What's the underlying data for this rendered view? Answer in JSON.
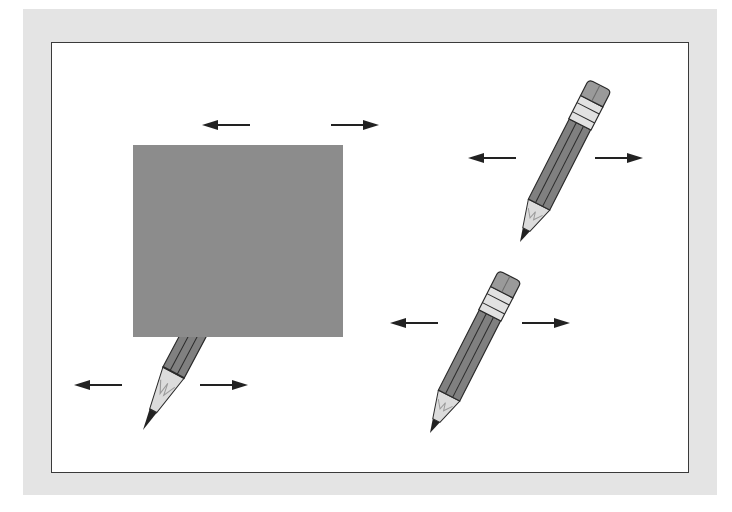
{
  "figure": {
    "colors": {
      "page_background": "#ffffff",
      "outer_border": "#e4e4e4",
      "inner_panel": "#ffffff",
      "inner_panel_stroke": "#3a3a3a",
      "occluder": "#8c8c8c",
      "pencil_body": "#808080",
      "pencil_body_stroke": "#2a2a2a",
      "ferrule": "#e2e2e2",
      "eraser": "#9a9a9a",
      "wood_tip": "#d8d8d8",
      "graphite": "#222222",
      "arrow": "#222222"
    },
    "elements": [
      {
        "id": "occluded-pencil",
        "occluded": true,
        "arrows": [
          "left",
          "right"
        ]
      },
      {
        "id": "pencil-top-right",
        "occluded": false,
        "arrows": [
          "left",
          "right"
        ]
      },
      {
        "id": "pencil-bottom-right",
        "occluded": false,
        "arrows": [
          "left",
          "right"
        ]
      },
      {
        "id": "pencil-bottom-left-tip",
        "occluded": false,
        "arrows": [
          "left",
          "right"
        ]
      }
    ],
    "occluder": {
      "shape": "rectangle",
      "x": 133,
      "y": 145,
      "width": 210,
      "height": 192
    }
  }
}
